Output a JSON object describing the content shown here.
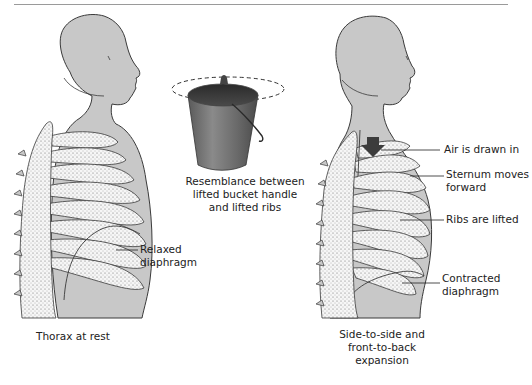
{
  "figure": {
    "left_panel": {
      "caption": "Thorax at rest",
      "labels": {
        "diaphragm_line1": "Relaxed",
        "diaphragm_line2": "diaphragm"
      }
    },
    "center_panel": {
      "caption_line1": "Resemblance between",
      "caption_line2": "lifted bucket handle",
      "caption_line3": "and lifted ribs"
    },
    "right_panel": {
      "caption_line1": "Side-to-side and",
      "caption_line2": "front-to-back",
      "caption_line3": "expansion",
      "labels": {
        "air": "Air is drawn in",
        "sternum_line1": "Sternum moves",
        "sternum_line2": "forward",
        "ribs": "Ribs are lifted",
        "diaphragm_line1": "Contracted",
        "diaphragm_line2": "diaphragm"
      }
    },
    "colors": {
      "body_fill": "#c8c8c8",
      "outline": "#3a3a3a",
      "bone_fill": "#f4f4f4",
      "bucket_dark": "#3a3a3a",
      "bucket_mid": "#6d6d6d",
      "arrow": "#3c3c3c"
    }
  }
}
